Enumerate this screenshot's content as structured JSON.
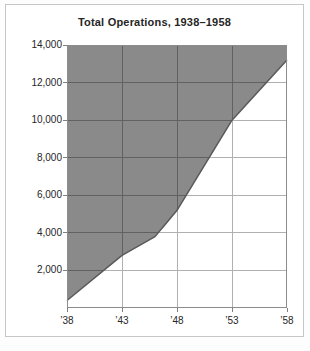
{
  "chart_card": {
    "title": "Total Operations, 1938–1958"
  },
  "chart_data": {
    "type": "area",
    "title": "Total Operations, 1938–1958",
    "x": [
      1938,
      1943,
      1946,
      1947,
      1948,
      1953,
      1958
    ],
    "values": [
      400,
      2800,
      3800,
      4500,
      5200,
      10000,
      13200
    ],
    "xlim": [
      1938,
      1958
    ],
    "ylim": [
      0,
      14000
    ],
    "x_ticks": [
      1938,
      1943,
      1948,
      1953,
      1958
    ],
    "x_tick_labels": [
      "’38",
      "’43",
      "’48",
      "’53",
      "’58"
    ],
    "y_ticks": [
      2000,
      4000,
      6000,
      8000,
      10000,
      12000,
      14000
    ],
    "y_tick_labels": [
      "2,000",
      "4,000",
      "6,000",
      "8,000",
      "10,000",
      "12,000",
      "14,000"
    ],
    "grid": true,
    "legend": "none",
    "fill_region": "above-curve",
    "colors": {
      "fill": "#8a8a8a",
      "curve": "#595959",
      "grid_light": "#b0b0b0",
      "grid_dark": "#616161",
      "plot_border": "#8c8c8c",
      "tick": "#7f7f7f",
      "text": "#262626",
      "card_border": "#c6c6c6",
      "card_bg": "#ffffff"
    }
  }
}
